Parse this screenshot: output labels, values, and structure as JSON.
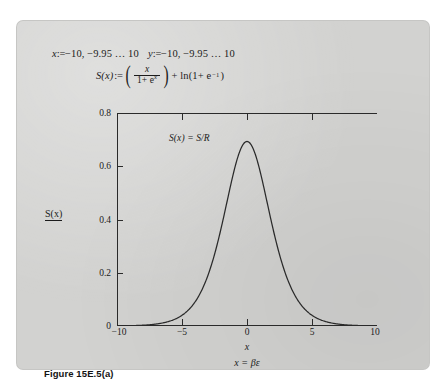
{
  "figure": {
    "caption": "Figure 15E.5(a)"
  },
  "worksheet": {
    "range_x": {
      "var": "x",
      "assign": ":=",
      "text": "−10, −9.95 … 10"
    },
    "range_y": {
      "var": "y",
      "assign": ":=",
      "text": "−10, −9.95 … 10"
    },
    "definition": {
      "lhs": "S(x)",
      "assign": ":=",
      "numerator": "x",
      "denominator_base": "1+ e",
      "denominator_exp": "x",
      "tail": "+ ln(1+ e",
      "tail_exp": "−1",
      "tail_close": ")"
    }
  },
  "chart_data": {
    "type": "line",
    "title": "",
    "annotation": "S(x) = S/R",
    "xlabel": "x",
    "xlabel2": "x = βε",
    "ylabel": "S(x)",
    "grid": false,
    "legend": false,
    "xlim": [
      -10,
      10
    ],
    "ylim": [
      0,
      0.8
    ],
    "xticks": [
      -10,
      -5,
      0,
      5,
      10
    ],
    "xticklabels": [
      "−10",
      "−5",
      "0",
      "5",
      "10"
    ],
    "yticks": [
      0,
      0.2,
      0.4,
      0.6,
      0.8
    ],
    "yticklabels": [
      "0",
      "0.2",
      "0.4",
      "0.6",
      "0.8"
    ],
    "series": [
      {
        "name": "S(x)",
        "x": [
          -10,
          -9.5,
          -9,
          -8.5,
          -8,
          -7.5,
          -7,
          -6.5,
          -6,
          -5.5,
          -5,
          -4.5,
          -4,
          -3.5,
          -3,
          -2.5,
          -2,
          -1.5,
          -1,
          -0.5,
          0,
          0.5,
          1,
          1.5,
          2,
          2.5,
          3,
          3.5,
          4,
          4.5,
          5,
          5.5,
          6,
          6.5,
          7,
          7.5,
          8,
          8.5,
          9,
          9.5,
          10
        ],
        "y": [
          0.0005,
          0.0008,
          0.0012,
          0.0019,
          0.003,
          0.0049,
          0.0073,
          0.0117,
          0.0174,
          0.026,
          0.0387,
          0.0565,
          0.0803,
          0.112,
          0.1517,
          0.1993,
          0.253,
          0.3094,
          0.3651,
          0.4136,
          0.45,
          0.4713,
          0.474,
          0.4602,
          0.433,
          0.3953,
          0.3521,
          0.3054,
          0.2598,
          0.217,
          0.1781,
          0.1437,
          0.1141,
          0.0894,
          0.0693,
          0.0531,
          0.0403,
          0.0303,
          0.0227,
          0.0168,
          0.0124
        ]
      }
    ],
    "peak": {
      "x": 0,
      "y": 0.69
    }
  }
}
